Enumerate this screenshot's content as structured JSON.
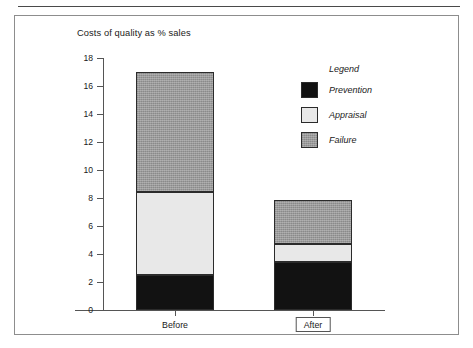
{
  "figure": {
    "title": "Costs of quality as % sales"
  },
  "legend": {
    "title": "Legend",
    "entries": [
      {
        "label": "Prevention",
        "color": "#121212",
        "swatch_name": "legend-swatch-prevention"
      },
      {
        "label": "Appraisal",
        "color": "#e8e8e8",
        "swatch_name": "legend-swatch-appraisal"
      },
      {
        "label": "Failure",
        "color": "#9a9a9a",
        "swatch_name": "legend-swatch-failure"
      }
    ]
  },
  "axes": {
    "y_ticks": [
      "0",
      "2",
      "4",
      "6",
      "8",
      "10",
      "12",
      "14",
      "16",
      "18"
    ],
    "x_ticks": [
      "Before",
      "After"
    ]
  },
  "chart_data": {
    "type": "bar",
    "subtype": "stacked-vertical",
    "title": "Costs of quality as % sales",
    "xlabel": "",
    "ylabel": "",
    "ylim": [
      0,
      18
    ],
    "ytick_step": 2,
    "grid": false,
    "legend_position": "right",
    "legend_title": "Legend",
    "categories": [
      "Before",
      "After"
    ],
    "series": [
      {
        "name": "Prevention",
        "color": "#121212",
        "values": [
          2.5,
          3.4
        ]
      },
      {
        "name": "Appraisal",
        "color": "#e8e8e8",
        "values": [
          5.9,
          1.3
        ]
      },
      {
        "name": "Failure",
        "color": "#9a9a9a",
        "values": [
          8.6,
          3.15
        ]
      }
    ],
    "totals": [
      17.0,
      7.85
    ],
    "stack_boundaries": {
      "Before": [
        0,
        2.5,
        8.4,
        17.0
      ],
      "After": [
        0,
        3.4,
        4.7,
        7.85
      ]
    },
    "annotations": {
      "boxed_category_label": "After"
    }
  }
}
